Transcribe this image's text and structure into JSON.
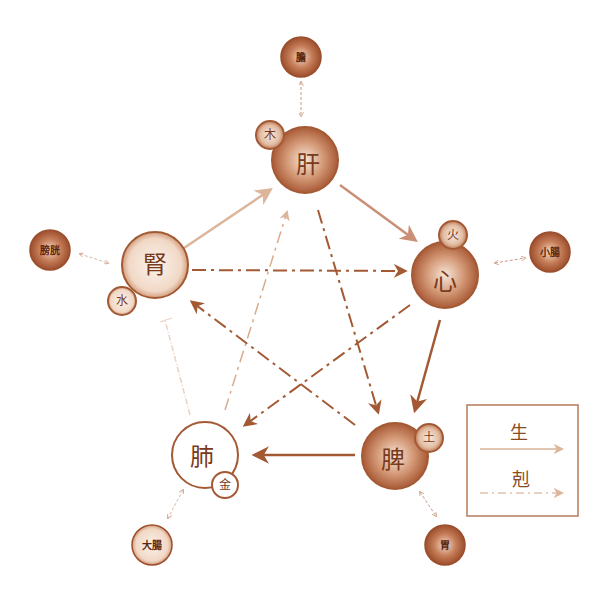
{
  "diagram": {
    "type": "five-elements-organ-cycle",
    "colors": {
      "stroke_dark": "#a35a34",
      "stroke_light": "#d9ab8c",
      "fill_dark": "#b86a45",
      "fill_mid": "#d9a888",
      "fill_light": "#f3e1d4",
      "text": "#7a3a1c"
    },
    "zang_organs": [
      {
        "id": "liver",
        "label": "肝",
        "element": "木"
      },
      {
        "id": "heart",
        "label": "心",
        "element": "火"
      },
      {
        "id": "spleen",
        "label": "脾",
        "element": "土"
      },
      {
        "id": "lung",
        "label": "肺",
        "element": "金"
      },
      {
        "id": "kidney",
        "label": "腎",
        "element": "水"
      }
    ],
    "fu_organs": [
      {
        "id": "gallbladder",
        "label": "膽",
        "paired_with": "肝"
      },
      {
        "id": "small_intestine",
        "label": "小腸",
        "paired_with": "心"
      },
      {
        "id": "stomach",
        "label": "胃",
        "paired_with": "脾"
      },
      {
        "id": "large_intestine",
        "label": "大腸",
        "paired_with": "肺"
      },
      {
        "id": "bladder",
        "label": "膀胱",
        "paired_with": "腎"
      }
    ],
    "generating_edges": [
      {
        "from": "腎",
        "to": "肝"
      },
      {
        "from": "肝",
        "to": "心"
      },
      {
        "from": "心",
        "to": "脾"
      },
      {
        "from": "脾",
        "to": "肺"
      },
      {
        "from": "肺",
        "to": "腎"
      }
    ],
    "controlling_edges": [
      {
        "from": "腎",
        "to": "心"
      },
      {
        "from": "心",
        "to": "肺"
      },
      {
        "from": "肺",
        "to": "肝"
      },
      {
        "from": "肝",
        "to": "脾"
      },
      {
        "from": "脾",
        "to": "腎"
      }
    ],
    "legend": {
      "generate_label": "生",
      "control_label": "剋"
    }
  }
}
